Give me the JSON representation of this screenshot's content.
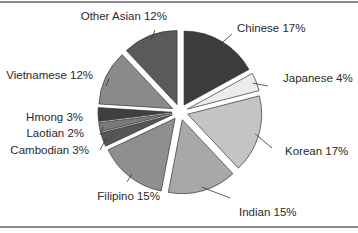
{
  "chart_data": {
    "type": "pie",
    "title": "",
    "exploded": true,
    "start_angle": "12 o'clock",
    "direction": "clockwise",
    "categories": [
      "Chinese",
      "Japanese",
      "Korean",
      "Indian",
      "Filipino",
      "Cambodian",
      "Laotian",
      "Hmong",
      "Vietnamese",
      "Other Asian"
    ],
    "values": [
      17,
      4,
      17,
      15,
      15,
      3,
      2,
      3,
      12,
      12
    ],
    "labels": [
      "Chinese 17%",
      "Japanese 4%",
      "Korean 17%",
      "Indian 15%",
      "Filipino 15%",
      "Cambodian 3%",
      "Laotian 2%",
      "Hmong 3%",
      "Vietnamese 12%",
      "Other Asian 12%"
    ],
    "colors": [
      "#3c3c3c",
      "#ececec",
      "#c4c4c4",
      "#a8a8a8",
      "#8f8f8f",
      "#555555",
      "#7a7a7a",
      "#3f3f3f",
      "#8a8a8a",
      "#5a5a5a"
    ],
    "legend": "none (labels with leader lines)"
  }
}
